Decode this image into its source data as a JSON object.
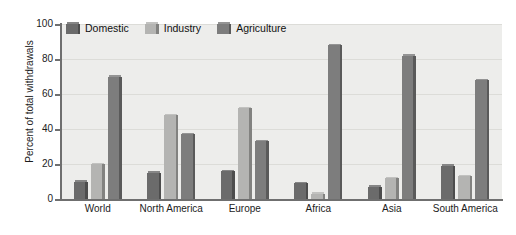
{
  "chart_data": {
    "type": "bar",
    "title": "",
    "subtitle": "",
    "xlabel": "",
    "ylabel": "Percent of total withdrawals",
    "ylim": [
      0,
      100
    ],
    "yticks": [
      0,
      20,
      40,
      60,
      80,
      100
    ],
    "grid": true,
    "legend_position": "top-left",
    "categories": [
      "World",
      "North America",
      "Europe",
      "Africa",
      "Asia",
      "South America"
    ],
    "series": [
      {
        "name": "Domestic",
        "color": "#6b6b6b",
        "values": [
          10,
          15,
          16,
          9,
          7,
          19
        ]
      },
      {
        "name": "Industry",
        "color": "#b4b4b2",
        "values": [
          20,
          48,
          52,
          3,
          12,
          13
        ]
      },
      {
        "name": "Agriculture",
        "color": "#7d7d7d",
        "values": [
          70,
          37,
          33,
          88,
          82,
          68
        ]
      }
    ]
  },
  "legend": {
    "items": [
      {
        "label": "Domestic"
      },
      {
        "label": "Industry"
      },
      {
        "label": "Agriculture"
      }
    ]
  },
  "axes": {
    "y_title": "Percent of total withdrawals",
    "y_tick_labels": [
      "0",
      "20",
      "40",
      "60",
      "80",
      "100"
    ],
    "x_tick_labels": [
      "World",
      "North America",
      "Europe",
      "Africa",
      "Asia",
      "South America"
    ]
  },
  "colors": {
    "plot_background": "#ededeb",
    "page_background": "#ffffff",
    "axis": "#6f6f6f",
    "gridline": "#dcdcd8",
    "domestic": "#6b6b6b",
    "industry": "#b4b4b2",
    "agriculture": "#7d7d7d"
  }
}
